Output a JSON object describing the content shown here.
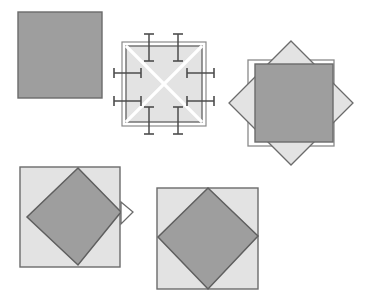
{
  "document": {
    "title": "Square and rotated-square construction figures",
    "canvas": {
      "width": 366,
      "height": 297,
      "background": "#ffffff"
    }
  },
  "palette": {
    "dark_gray_fill": "#9e9e9e",
    "light_gray_fill": "#e3e3e3",
    "shape_stroke": "#6b6b6b",
    "thin_stroke": "#8a8a8a",
    "tick_stroke": "#4d4d4d",
    "white_cross": "#ffffff",
    "background": "#ffffff"
  },
  "figures": [
    {
      "id": "figure-1",
      "name": "solid-gray-square",
      "caption": "Plain filled square",
      "square": {
        "x": 18,
        "y": 12,
        "width": 84,
        "height": 86
      },
      "fill": "#9e9e9e",
      "stroke": "#6b6b6b",
      "stroke_width": 1.4
    },
    {
      "id": "figure-2",
      "name": "crossed-square-with-ticks",
      "caption": "Light square with white diagonal cross and fold tick marks",
      "outer_square": {
        "x": 122,
        "y": 42,
        "width": 84,
        "height": 84
      },
      "inner_square": {
        "x": 126,
        "y": 46,
        "width": 76,
        "height": 76
      },
      "inner_fill": "#e3e3e3",
      "cross_color": "#ffffff",
      "cross_width": 3.2,
      "tick_count": 8,
      "ticks": [
        {
          "side": "top",
          "along": 0.3
        },
        {
          "side": "top",
          "along": 0.7
        },
        {
          "side": "bottom",
          "along": 0.3
        },
        {
          "side": "bottom",
          "along": 0.7
        },
        {
          "side": "left",
          "along": 0.3
        },
        {
          "side": "left",
          "along": 0.7
        },
        {
          "side": "right",
          "along": 0.3
        },
        {
          "side": "right",
          "along": 0.7
        }
      ],
      "tick_length": 18,
      "tick_cap": 9
    },
    {
      "id": "figure-3",
      "name": "diamond-behind-square-overlay",
      "caption": "Rotated light diamond with outlined square and dark square overlay",
      "outline_square": {
        "x": 248,
        "y": 60,
        "width": 86,
        "height": 86
      },
      "diamond": {
        "cx": 291,
        "cy": 103,
        "radius": 62,
        "rotation": 45
      },
      "diamond_fill": "#e3e3e3",
      "top_square": {
        "x": 255,
        "y": 64,
        "width": 78,
        "height": 78
      },
      "top_fill": "#9e9e9e"
    },
    {
      "id": "figure-4",
      "name": "inscribed-diamond-with-tab",
      "caption": "Light square with inscribed dark diamond and small triangular tab",
      "square": {
        "x": 20,
        "y": 167,
        "width": 100,
        "height": 100
      },
      "square_fill": "#e3e3e3",
      "diamond_fill": "#9e9e9e",
      "diamond_points": "78,168 121,212 78,265 27,217",
      "tab_points": "121,202 133,212 121,224",
      "tab_fill": "#ffffff"
    },
    {
      "id": "figure-5",
      "name": "inscribed-diamond-square",
      "caption": "Light square with inscribed tilted dark diamond",
      "square": {
        "x": 157,
        "y": 188,
        "width": 101,
        "height": 101
      },
      "square_fill": "#e3e3e3",
      "diamond_fill": "#9e9e9e",
      "diamond_points": "208,188 258,236 208,289 158,237"
    }
  ]
}
